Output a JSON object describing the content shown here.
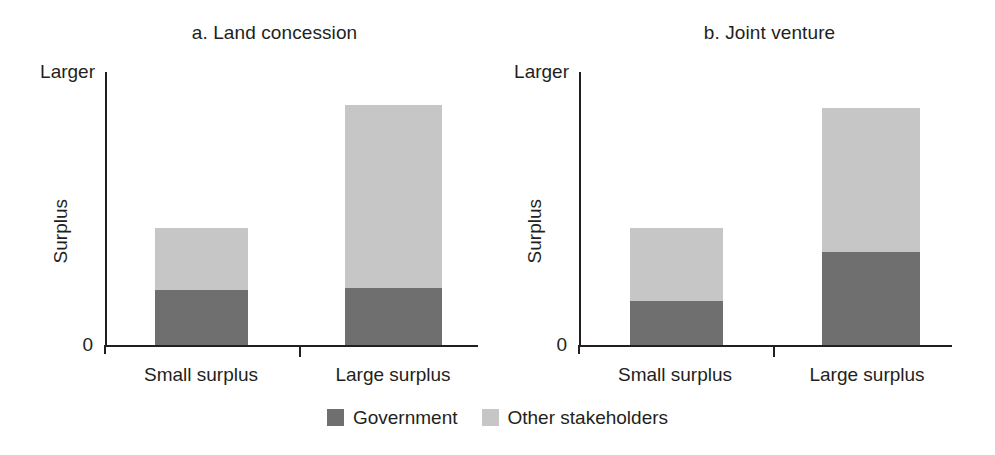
{
  "chart_data": {
    "type": "bar",
    "subtype": "stacked-bar",
    "title": "",
    "panels": [
      {
        "key": "a",
        "title": "a. Land concession",
        "xlabel": "",
        "ylabel": "Surplus",
        "categories": [
          "Small surplus",
          "Large surplus"
        ],
        "ylim": [
          0,
          1
        ],
        "ytick_labels": [
          "0",
          "Larger"
        ],
        "grid": false,
        "series": [
          {
            "name": "Government",
            "values": [
              0.2,
              0.21
            ],
            "color": "#706f6f"
          },
          {
            "name": "Other stakeholders",
            "values": [
              0.23,
              0.67
            ],
            "color": "#c6c6c6"
          }
        ],
        "totals": [
          0.43,
          0.88
        ]
      },
      {
        "key": "b",
        "title": "b. Joint venture",
        "xlabel": "",
        "ylabel": "Surplus",
        "categories": [
          "Small surplus",
          "Large surplus"
        ],
        "ylim": [
          0,
          1
        ],
        "ytick_labels": [
          "0",
          "Larger"
        ],
        "grid": false,
        "series": [
          {
            "name": "Government",
            "values": [
              0.16,
              0.34
            ],
            "color": "#706f6f"
          },
          {
            "name": "Other stakeholders",
            "values": [
              0.27,
              0.53
            ],
            "color": "#c6c6c6"
          }
        ],
        "totals": [
          0.43,
          0.87
        ]
      }
    ],
    "legend": {
      "position": "bottom-center",
      "entries": [
        {
          "label": "Government",
          "color": "#706f6f"
        },
        {
          "label": "Other stakeholders",
          "color": "#c6c6c6"
        }
      ]
    },
    "colors": {
      "government": "#706f6f",
      "other_stakeholders": "#c6c6c6",
      "axis": "#231f20",
      "background": "#ffffff"
    }
  }
}
